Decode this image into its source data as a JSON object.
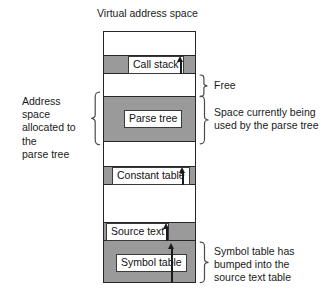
{
  "diagram": {
    "title": "Virtual address space",
    "type": "memory-layout",
    "colors": {
      "used_fill": "#9a9a9a",
      "free_fill": "#ffffff",
      "outline": "#262626",
      "text": "#1a1a1a"
    },
    "memory_box": {
      "segments": [
        {
          "id": "top-free",
          "label": null,
          "state": "free",
          "has_arrow": false
        },
        {
          "id": "call-stack",
          "label": "Call stack",
          "state": "used",
          "has_arrow": true,
          "arrow": "up"
        },
        {
          "id": "free-gap",
          "label": null,
          "state": "free",
          "has_arrow": false
        },
        {
          "id": "parse-tree",
          "label": "Parse tree",
          "state": "used",
          "has_arrow": false
        },
        {
          "id": "free-gap-2",
          "label": null,
          "state": "free",
          "has_arrow": false
        },
        {
          "id": "constant-table",
          "label": "Constant table",
          "state": "used",
          "has_arrow": true,
          "arrow": "up"
        },
        {
          "id": "free-gap-3",
          "label": null,
          "state": "free",
          "has_arrow": false
        },
        {
          "id": "source-text",
          "label": "Source text",
          "state": "used",
          "has_arrow": true,
          "arrow": "up"
        },
        {
          "id": "symbol-table",
          "label": "Symbol table",
          "state": "used",
          "has_arrow": true,
          "arrow": "up"
        }
      ]
    },
    "annotations": {
      "left": [
        {
          "id": "address-space-allocated",
          "text": "Address space allocated to the parse tree"
        }
      ],
      "right": [
        {
          "id": "free",
          "text": "Free"
        },
        {
          "id": "space-in-use",
          "text": "Space currently being used by the parse tree"
        },
        {
          "id": "symbol-table-bump",
          "text": "Symbol table has bumped into the source text table"
        }
      ]
    },
    "labels": {
      "call_stack": "Call stack",
      "parse_tree": "Parse tree",
      "constant_table": "Constant table",
      "source_text": "Source text",
      "symbol_table": "Symbol table",
      "free": "Free",
      "space_in_use_line1": "Space currently being",
      "space_in_use_line2": "used by the parse tree",
      "address_space_line1": "Address space",
      "address_space_line2": "allocated to the",
      "address_space_line3": "parse tree",
      "bump_line1": "Symbol table has",
      "bump_line2": "bumped into the",
      "bump_line3": "source text table"
    }
  }
}
